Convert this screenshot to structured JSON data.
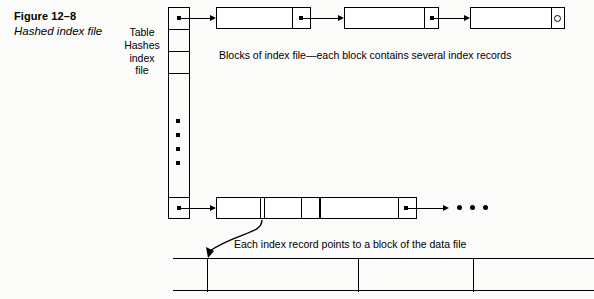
{
  "figure": {
    "number": "Figure 12–8",
    "title": "Hashed index file"
  },
  "hash_table": {
    "label": "Table Hashes index file",
    "label_lines": [
      "Table",
      "Hashes",
      "index",
      "file"
    ],
    "slot_count_visible": 5,
    "ellipsis_dots": 4,
    "pointer_slots": [
      "top",
      "bottom"
    ]
  },
  "captions": {
    "index_blocks": "Blocks of index file—each block contains several index records",
    "data_pointer": "Each index record points to a block of the data file"
  },
  "index_chain_top": {
    "blocks": [
      {
        "id": "block-1",
        "pointer": "filled-dot",
        "segments": 1
      },
      {
        "id": "block-2",
        "pointer": "filled-dot",
        "segments": 1
      },
      {
        "id": "block-3",
        "pointer": "null-circle",
        "segments": 1
      }
    ]
  },
  "index_chain_bottom": {
    "blocks": [
      {
        "id": "block-4",
        "pointer": "none",
        "segments": 2
      },
      {
        "id": "block-5",
        "pointer": "filled-dot",
        "segments": 1
      }
    ],
    "trailing_ellipsis": "• • •"
  },
  "data_file": {
    "blocks": 4,
    "divider_positions_px": [
      34,
      185,
      300
    ]
  },
  "colors": {
    "ink": "#000000",
    "page": "#fbfbfa",
    "fill": "#ffffff"
  }
}
